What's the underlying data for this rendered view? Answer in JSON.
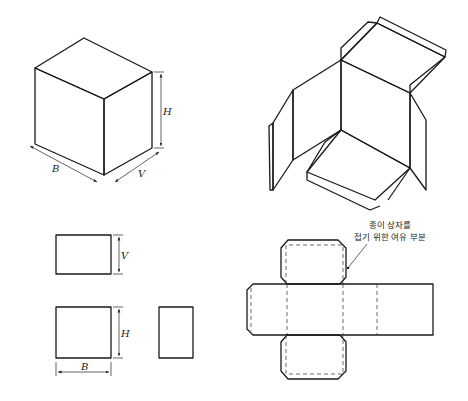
{
  "figure": {
    "cube": {
      "labels": {
        "height": "H",
        "width": "B",
        "depth": "V"
      }
    },
    "open_box": {
      "description": "unfolded paper box in isometric view"
    },
    "orthographic": {
      "top_view_label": "V",
      "front_view_height_label": "H",
      "front_view_width_label": "B"
    },
    "net": {
      "annotation_line1": "종이 상자를",
      "annotation_line2": "접기 위한 여유 부분"
    },
    "colors": {
      "line": "#1a1a1a",
      "shade": "#9a9a9a",
      "background": "#ffffff"
    }
  }
}
